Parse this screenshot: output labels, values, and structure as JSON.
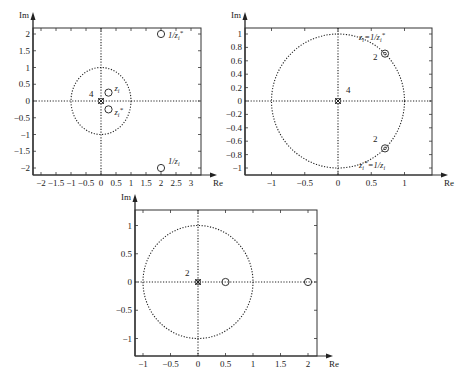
{
  "chart_data": [
    {
      "type": "scatter",
      "title": "",
      "xlabel": "Re",
      "ylabel": "Im",
      "xlim": [
        -2.3,
        3.4
      ],
      "ylim": [
        -2.2,
        2.2
      ],
      "x_ticks": [
        -2,
        -1.5,
        -1,
        -0.5,
        0,
        0.5,
        1,
        1.5,
        2,
        2.5,
        3
      ],
      "x_tick_labels": [
        "-2",
        "-1.5",
        "-1",
        "-0.5",
        "0",
        "0.5",
        "1",
        "1.5",
        "2",
        "2.5",
        "3"
      ],
      "y_ticks": [
        2,
        1.5,
        1,
        0.5,
        0,
        -0.5,
        -1,
        -1.5,
        -2
      ],
      "y_tick_labels": [
        "2",
        "1.5",
        "1",
        "0.5",
        "0",
        "-0.5",
        "-1",
        "-1.5",
        "-2"
      ],
      "unit_circle": true,
      "grid": false,
      "series": [
        {
          "name": "zeros",
          "marker": "o",
          "points": [
            [
              0.25,
              0.25
            ],
            [
              0.25,
              -0.25
            ],
            [
              2,
              2
            ],
            [
              2,
              -2
            ]
          ]
        },
        {
          "name": "poles",
          "marker": "x",
          "points": [
            [
              0,
              0
            ]
          ],
          "multiplicity": 4
        }
      ],
      "annotations": [
        {
          "text": "z_i",
          "x": 0.25,
          "y": 0.25
        },
        {
          "text": "z_i*",
          "x": 0.25,
          "y": -0.25
        },
        {
          "text": "1/z_i*",
          "x": 2,
          "y": 2
        },
        {
          "text": "1/z_i",
          "x": 2,
          "y": -2
        },
        {
          "text": "4",
          "x": 0,
          "y": 0
        }
      ]
    },
    {
      "type": "scatter",
      "title": "",
      "xlabel": "Re",
      "ylabel": "Im",
      "xlim": [
        -1.4,
        1.4
      ],
      "ylim": [
        -1.1,
        1.1
      ],
      "x_ticks": [
        -1,
        -0.5,
        0,
        0.5,
        1
      ],
      "x_tick_labels": [
        "-1",
        "-0.5",
        "0",
        "0.5",
        "1"
      ],
      "y_ticks": [
        1,
        0.8,
        0.6,
        0.4,
        0.2,
        0,
        -0.2,
        -0.4,
        -0.6,
        -0.8,
        -1
      ],
      "y_tick_labels": [
        "1",
        "0.8",
        "0.6",
        "0.4",
        "0.2",
        "0",
        "-0.2",
        "-0.4",
        "-0.6",
        "-0.8",
        "-1"
      ],
      "unit_circle": true,
      "grid": false,
      "series": [
        {
          "name": "zeros",
          "marker": "o",
          "points": [
            [
              0.707,
              0.707
            ],
            [
              0.707,
              -0.707
            ]
          ],
          "multiplicity": 2
        },
        {
          "name": "poles",
          "marker": "x",
          "points": [
            [
              0,
              0
            ]
          ],
          "multiplicity": 4
        }
      ],
      "annotations": [
        {
          "text": "z_i=1/z_i*",
          "x": 0.707,
          "y": 0.707
        },
        {
          "text": "z_i*=1/z_i",
          "x": 0.707,
          "y": -0.707
        },
        {
          "text": "2",
          "x": 0.707,
          "y": 0.707
        },
        {
          "text": "2",
          "x": 0.707,
          "y": -0.707
        },
        {
          "text": "4",
          "x": 0,
          "y": 0
        }
      ]
    },
    {
      "type": "scatter",
      "title": "",
      "xlabel": "Re",
      "ylabel": "Im",
      "xlim": [
        -1.15,
        2.15
      ],
      "ylim": [
        -1.3,
        1.3
      ],
      "x_ticks": [
        -1,
        -0.5,
        0,
        0.5,
        1,
        1.5,
        2
      ],
      "x_tick_labels": [
        "-1",
        "-0.5",
        "0",
        "0.5",
        "1",
        "1.5",
        "2"
      ],
      "y_ticks": [
        1,
        0.5,
        0,
        -0.5,
        -1
      ],
      "y_tick_labels": [
        "1",
        "0.5",
        "0",
        "-0.5",
        "-1"
      ],
      "unit_circle": true,
      "grid": false,
      "series": [
        {
          "name": "zeros",
          "marker": "o",
          "points": [
            [
              0.5,
              0
            ],
            [
              2,
              0
            ]
          ]
        },
        {
          "name": "poles",
          "marker": "x",
          "points": [
            [
              0,
              0
            ]
          ],
          "multiplicity": 2
        }
      ],
      "annotations": [
        {
          "text": "2",
          "x": 0,
          "y": 0
        }
      ]
    }
  ],
  "plots": [
    {
      "xlabel": "Re",
      "ylabel": "Im"
    },
    {
      "xlabel": "Re",
      "ylabel": "Im"
    },
    {
      "xlabel": "Re",
      "ylabel": "Im"
    }
  ]
}
